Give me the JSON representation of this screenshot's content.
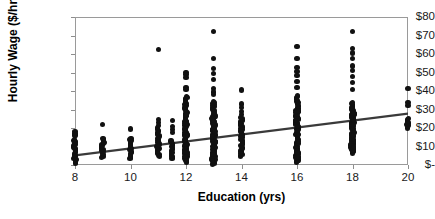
{
  "chart": {
    "type": "scatter",
    "title": "",
    "xlabel": "Education (yrs)",
    "ylabel": "Hourly Wage ($/hr)",
    "accent_color": "#111111",
    "trendline_color": "#3a3a3a",
    "axis_color": "#9a9a9a"
  },
  "chart_data": {
    "type": "scatter",
    "title": "",
    "xlabel": "Education (yrs)",
    "ylabel": "Hourly Wage ($/hr)",
    "xlim": [
      8,
      20
    ],
    "ylim": [
      0,
      80
    ],
    "xticks": [
      8,
      10,
      12,
      14,
      16,
      18,
      20
    ],
    "xtick_labels": [
      "8",
      "10",
      "12",
      "14",
      "16",
      "18",
      "20"
    ],
    "yticks": [
      0,
      10,
      20,
      30,
      40,
      50,
      60,
      70,
      80
    ],
    "ytick_labels": [
      "$-",
      "$10",
      "$20",
      "$30",
      "$40",
      "$50",
      "$60",
      "$70",
      "$80"
    ],
    "grid": false,
    "legend": null,
    "marker": "filled-circle",
    "trendline": {
      "type": "linear",
      "x_start": 8,
      "y_start": 5.2,
      "x_end": 20,
      "y_end": 27.8,
      "slope": 1.88,
      "intercept": -9.85
    },
    "columns": [
      {
        "x": 8,
        "y_min": 1.0,
        "y_max": 18.0,
        "y_dense_max": 14.0,
        "count": 34,
        "outliers": [
          18.0,
          17.0,
          16.2
        ]
      },
      {
        "x": 9,
        "y_min": 4.0,
        "y_max": 22.0,
        "y_dense_max": 14.5,
        "count": 20,
        "outliers": [
          22.0
        ]
      },
      {
        "x": 10,
        "y_min": 3.5,
        "y_max": 19.5,
        "y_dense_max": 14.5,
        "count": 24,
        "outliers": [
          19.5
        ]
      },
      {
        "x": 11,
        "y_min": 4.5,
        "y_max": 62.5,
        "y_dense_max": 20.0,
        "count": 30,
        "outliers": [
          62.5,
          24.5,
          23.0,
          21.5
        ]
      },
      {
        "x": 11.5,
        "y_min": 3.5,
        "y_max": 24.0,
        "y_dense_max": 13.0,
        "count": 22,
        "outliers": [
          24.0,
          21.0,
          19.0,
          17.5
        ]
      },
      {
        "x": 12,
        "y_min": 1.5,
        "y_max": 50.0,
        "y_dense_max": 37.0,
        "count": 62,
        "outliers": [
          50.0,
          49.0,
          47.5,
          42.0,
          41.0
        ]
      },
      {
        "x": 13,
        "y_min": 0.5,
        "y_max": 72.0,
        "y_dense_max": 34.5,
        "count": 96,
        "outliers": [
          72.0,
          57.5,
          52.0,
          49.5,
          46.0,
          41.5,
          39.5,
          38.0
        ]
      },
      {
        "x": 14,
        "y_min": 4.5,
        "y_max": 40.5,
        "y_dense_max": 25.5,
        "count": 30,
        "outliers": [
          40.5,
          33.0,
          31.0,
          29.0,
          27.5
        ]
      },
      {
        "x": 16,
        "y_min": 1.5,
        "y_max": 64.0,
        "y_dense_max": 37.5,
        "count": 70,
        "outliers": [
          64.0,
          57.5,
          52.5,
          50.5,
          48.5,
          45.0,
          42.0
        ]
      },
      {
        "x": 18,
        "y_min": 6.5,
        "y_max": 72.0,
        "y_dense_max": 34.0,
        "count": 72,
        "outliers": [
          72.0,
          63.0,
          60.5,
          57.5,
          53.5,
          51.0,
          48.0,
          44.5,
          41.0
        ]
      },
      {
        "x": 20,
        "y_min": 20.0,
        "y_max": 41.5,
        "y_dense_max": 25.0,
        "count": 12,
        "outliers": [
          41.5,
          34.0,
          32.0
        ]
      }
    ]
  }
}
